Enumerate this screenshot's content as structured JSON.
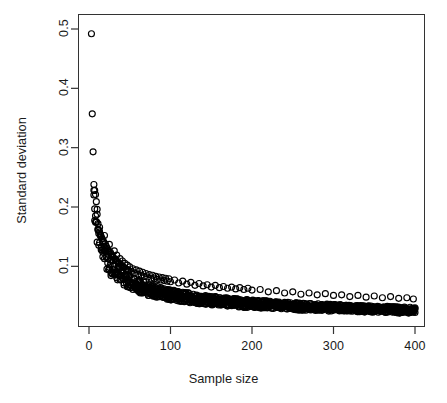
{
  "chart_data": {
    "type": "scatter",
    "title": "",
    "xlabel": "Sample size",
    "ylabel": "Standard deviation",
    "xlim": [
      0,
      400
    ],
    "ylim": [
      0,
      0.52
    ],
    "grid": false,
    "legend": null,
    "marker": "open-circle",
    "marker_color": "#000000",
    "marker_radius_px": 3.0,
    "xticks": [
      0,
      100,
      200,
      300,
      400
    ],
    "xticklabels": [
      "0",
      "100",
      "200",
      "300",
      "400"
    ],
    "yticks": [
      0.1,
      0.2,
      0.3,
      0.4,
      0.5
    ],
    "yticklabels": [
      "0.1",
      "0.2",
      "0.3",
      "0.4",
      "0.5"
    ],
    "ytick_rotation_deg": -90,
    "n_points": 400,
    "relationship": "sd decays approximately as 1/sqrt(sample size)",
    "points": [
      [
        3,
        0.492
      ],
      [
        4,
        0.357
      ],
      [
        5,
        0.293
      ],
      [
        6,
        0.238
      ],
      [
        7,
        0.228
      ],
      [
        8,
        0.221
      ],
      [
        9,
        0.209
      ],
      [
        10,
        0.196
      ],
      [
        11,
        0.163
      ],
      [
        12,
        0.161
      ],
      [
        13,
        0.158
      ],
      [
        14,
        0.152
      ],
      [
        15,
        0.15
      ],
      [
        16,
        0.146
      ],
      [
        17,
        0.143
      ],
      [
        18,
        0.141
      ],
      [
        19,
        0.152
      ],
      [
        20,
        0.138
      ],
      [
        21,
        0.134
      ],
      [
        22,
        0.131
      ],
      [
        23,
        0.128
      ],
      [
        24,
        0.126
      ],
      [
        25,
        0.137
      ],
      [
        26,
        0.124
      ],
      [
        27,
        0.121
      ],
      [
        28,
        0.118
      ],
      [
        29,
        0.116
      ],
      [
        30,
        0.115
      ],
      [
        31,
        0.126
      ],
      [
        32,
        0.112
      ],
      [
        33,
        0.11
      ],
      [
        34,
        0.119
      ],
      [
        35,
        0.108
      ],
      [
        36,
        0.106
      ],
      [
        37,
        0.105
      ],
      [
        38,
        0.113
      ],
      [
        39,
        0.103
      ],
      [
        40,
        0.101
      ],
      [
        41,
        0.109
      ],
      [
        42,
        0.099
      ],
      [
        43,
        0.098
      ],
      [
        44,
        0.105
      ],
      [
        45,
        0.096
      ],
      [
        46,
        0.095
      ],
      [
        47,
        0.102
      ],
      [
        48,
        0.094
      ],
      [
        49,
        0.093
      ],
      [
        50,
        0.099
      ],
      [
        52,
        0.091
      ],
      [
        54,
        0.096
      ],
      [
        56,
        0.089
      ],
      [
        58,
        0.094
      ],
      [
        60,
        0.087
      ],
      [
        62,
        0.092
      ],
      [
        64,
        0.085
      ],
      [
        66,
        0.09
      ],
      [
        68,
        0.083
      ],
      [
        70,
        0.088
      ],
      [
        72,
        0.082
      ],
      [
        74,
        0.086
      ],
      [
        76,
        0.08
      ],
      [
        78,
        0.085
      ],
      [
        80,
        0.079
      ],
      [
        82,
        0.083
      ],
      [
        84,
        0.078
      ],
      [
        86,
        0.082
      ],
      [
        88,
        0.077
      ],
      [
        90,
        0.081
      ],
      [
        92,
        0.076
      ],
      [
        94,
        0.08
      ],
      [
        96,
        0.075
      ],
      [
        98,
        0.079
      ],
      [
        100,
        0.074
      ],
      [
        105,
        0.077
      ],
      [
        110,
        0.072
      ],
      [
        115,
        0.075
      ],
      [
        120,
        0.07
      ],
      [
        125,
        0.073
      ],
      [
        130,
        0.068
      ],
      [
        135,
        0.071
      ],
      [
        140,
        0.067
      ],
      [
        145,
        0.069
      ],
      [
        150,
        0.065
      ],
      [
        155,
        0.068
      ],
      [
        160,
        0.064
      ],
      [
        165,
        0.066
      ],
      [
        170,
        0.063
      ],
      [
        175,
        0.065
      ],
      [
        180,
        0.062
      ],
      [
        185,
        0.064
      ],
      [
        190,
        0.061
      ],
      [
        195,
        0.063
      ],
      [
        200,
        0.06
      ],
      [
        210,
        0.061
      ],
      [
        220,
        0.057
      ],
      [
        230,
        0.059
      ],
      [
        240,
        0.055
      ],
      [
        250,
        0.057
      ],
      [
        260,
        0.053
      ],
      [
        270,
        0.055
      ],
      [
        280,
        0.052
      ],
      [
        290,
        0.054
      ],
      [
        300,
        0.051
      ],
      [
        310,
        0.052
      ],
      [
        320,
        0.049
      ],
      [
        330,
        0.051
      ],
      [
        340,
        0.048
      ],
      [
        350,
        0.05
      ],
      [
        360,
        0.047
      ],
      [
        370,
        0.049
      ],
      [
        380,
        0.046
      ],
      [
        390,
        0.047
      ],
      [
        398,
        0.045
      ]
    ]
  },
  "axis": {
    "x_title": "Sample size",
    "y_title": "Standard deviation"
  }
}
